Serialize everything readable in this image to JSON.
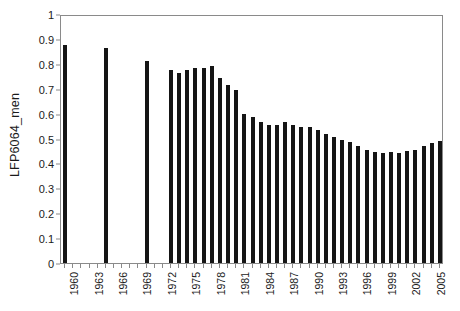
{
  "chart_data": {
    "type": "bar",
    "title": "",
    "xlabel": "",
    "ylabel": "LFP6064_men",
    "ylim": [
      0,
      1
    ],
    "ytick_labels": [
      "0",
      "0.1",
      "0.2",
      "0.3",
      "0.4",
      "0.5",
      "0.6",
      "0.7",
      "0.8",
      "0.9",
      "1"
    ],
    "ytick_values": [
      0,
      0.1,
      0.2,
      0.3,
      0.4,
      0.5,
      0.6,
      0.7,
      0.8,
      0.9,
      1
    ],
    "grid": false,
    "legend": null,
    "xtick_labels": [
      "1960",
      "1963",
      "1966",
      "1969",
      "1972",
      "1975",
      "1978",
      "1981",
      "1984",
      "1987",
      "1990",
      "1993",
      "1996",
      "1999",
      "2002",
      "2005"
    ],
    "xtick_label_step": 3,
    "x_domain": [
      1960,
      2006
    ],
    "bar_color": "#151515",
    "categories": [
      1960,
      1961,
      1962,
      1963,
      1964,
      1965,
      1966,
      1967,
      1968,
      1969,
      1970,
      1971,
      1972,
      1973,
      1974,
      1975,
      1976,
      1977,
      1978,
      1979,
      1980,
      1981,
      1982,
      1983,
      1984,
      1985,
      1986,
      1987,
      1988,
      1989,
      1990,
      1991,
      1992,
      1993,
      1994,
      1995,
      1996,
      1997,
      1998,
      1999,
      2000,
      2001,
      2002,
      2003,
      2004,
      2005,
      2006
    ],
    "values": [
      0.875,
      null,
      null,
      null,
      null,
      0.865,
      null,
      null,
      null,
      null,
      0.81,
      null,
      null,
      0.775,
      0.765,
      0.775,
      0.785,
      0.785,
      0.79,
      0.745,
      0.715,
      0.695,
      0.6,
      0.585,
      0.565,
      0.555,
      0.555,
      0.565,
      0.555,
      0.545,
      0.545,
      0.535,
      0.52,
      0.505,
      0.495,
      0.485,
      0.47,
      0.455,
      0.445,
      0.44,
      0.445,
      0.44,
      0.45,
      0.455,
      0.47,
      0.48,
      0.49
    ]
  }
}
